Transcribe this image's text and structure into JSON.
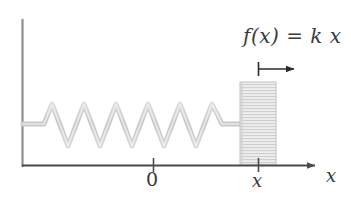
{
  "figure": {
    "background_color": "#ffffff"
  },
  "annotations": {
    "force_formula": "f(x) = k x",
    "force_formula_parts": {
      "function": "f(x)",
      "equals": "=",
      "spring_constant": "k",
      "displacement": "x"
    }
  },
  "axes": {
    "x_axis": {
      "label": "x",
      "color": "#555555",
      "arrow": true,
      "start_px": 22,
      "end_px": 322,
      "y_px": 165
    },
    "y_axis": {
      "label": "",
      "color": "#8a8a8a",
      "arrow": false,
      "x_px": 22,
      "top_px": 20,
      "bottom_px": 165
    },
    "ticks": [
      {
        "name": "origin",
        "label": "0",
        "x_px": 153
      },
      {
        "name": "displacement",
        "label": "x",
        "x_px": 258
      }
    ]
  },
  "elements": {
    "wall": {
      "name": "wall",
      "color": "#8a8a8a"
    },
    "spring": {
      "name": "spring",
      "color": "#cdcdcd",
      "coil_count": 8,
      "left_px": 22,
      "right_px": 240,
      "center_y_px": 124,
      "amplitude_px": 22
    },
    "block": {
      "name": "block",
      "fill_color": "#e6e6e6",
      "stripe_color": "#cfcfcf",
      "border_color": "#c4c4c4",
      "left_px": 240,
      "right_px": 276,
      "top_px": 82,
      "bottom_px": 165
    },
    "displacement_arrow": {
      "name": "displacement-arrow",
      "color": "#2b2b2b",
      "tick_x_px": 258,
      "end_x_px": 302,
      "y_px": 69,
      "tick_height_px": 14
    }
  }
}
